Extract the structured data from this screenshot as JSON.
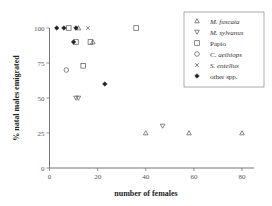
{
  "chart_data": {
    "type": "scatter",
    "title": "",
    "xlabel": "number of females",
    "ylabel": "% natal males emigrated",
    "xlim": [
      0,
      85
    ],
    "ylim": [
      0,
      100
    ],
    "xticks": [
      0,
      20,
      40,
      60,
      80
    ],
    "yticks": [
      0,
      25,
      50,
      75,
      100
    ],
    "grid": false,
    "legend_position": "upper right",
    "series": [
      {
        "name": "M. fuscata",
        "italic": true,
        "marker": "triangle-up",
        "points": [
          [
            12,
            100
          ],
          [
            18,
            90
          ],
          [
            40,
            25
          ],
          [
            58,
            25
          ],
          [
            80,
            25
          ]
        ]
      },
      {
        "name": "M. sylvanus",
        "italic": true,
        "marker": "triangle-down",
        "points": [
          [
            11,
            50
          ],
          [
            12,
            50
          ],
          [
            47,
            30
          ]
        ]
      },
      {
        "name": "Papio",
        "italic": false,
        "marker": "square",
        "points": [
          [
            8,
            100
          ],
          [
            11,
            90
          ],
          [
            17,
            90
          ],
          [
            14,
            73
          ],
          [
            36,
            100
          ]
        ]
      },
      {
        "name": "C. aethiops",
        "italic": true,
        "marker": "circle",
        "points": [
          [
            7,
            70
          ]
        ]
      },
      {
        "name": "S. entellus",
        "italic": true,
        "marker": "x",
        "points": [
          [
            16,
            100
          ]
        ]
      },
      {
        "name": "other spp.",
        "italic": false,
        "marker": "diamond",
        "points": [
          [
            3,
            100
          ],
          [
            6,
            100
          ],
          [
            10,
            90
          ],
          [
            11,
            100
          ],
          [
            23,
            60
          ]
        ]
      }
    ]
  }
}
